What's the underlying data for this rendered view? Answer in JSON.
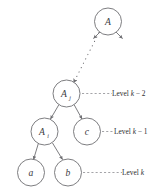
{
  "figure": {
    "type": "tree-diagram",
    "background_color": "#ffffff",
    "stroke_color": "#6e6e72",
    "text_color": "#2f2f33"
  },
  "nodes": [
    {
      "id": "A",
      "label": "A",
      "subscript": "",
      "cx": 108.0,
      "cy": 21.5,
      "r": 13.5
    },
    {
      "id": "Aj",
      "label": "A",
      "subscript": "j",
      "cx": 66.5,
      "cy": 93.5,
      "r": 13.5
    },
    {
      "id": "Ai",
      "label": "A",
      "subscript": "i",
      "cx": 44.5,
      "cy": 131.5,
      "r": 13.5
    },
    {
      "id": "c",
      "label": "c",
      "subscript": "",
      "cx": 87.0,
      "cy": 131.5,
      "r": 13.5
    },
    {
      "id": "a",
      "label": "a",
      "subscript": "",
      "cx": 31.0,
      "cy": 172.5,
      "r": 13.5
    },
    {
      "id": "b",
      "label": "b",
      "subscript": "",
      "cx": 68.0,
      "cy": 172.5,
      "r": 13.5
    }
  ],
  "edges": [
    {
      "from": "A",
      "to": "stub-left",
      "style": "solid",
      "arrow": true
    },
    {
      "from": "A",
      "to": "stub-right",
      "style": "solid",
      "arrow": true
    },
    {
      "from": "A",
      "to": "Aj",
      "style": "dotted",
      "arrow": true
    },
    {
      "from": "Aj",
      "to": "Ai",
      "style": "solid",
      "arrow": true
    },
    {
      "from": "Aj",
      "to": "c",
      "style": "solid",
      "arrow": true
    },
    {
      "from": "Ai",
      "to": "a",
      "style": "solid",
      "arrow": true
    },
    {
      "from": "Ai",
      "to": "b",
      "style": "solid",
      "arrow": true
    }
  ],
  "level_markers": [
    {
      "id": "level-k-minus-2",
      "text_prefix": "Level ",
      "text_var": "k",
      "text_suffix": " − 2",
      "anchor_node": "Aj",
      "leader_x1": 82,
      "leader_x2": 112,
      "y": 93.5,
      "text_x": 112
    },
    {
      "id": "level-k-minus-1",
      "text_prefix": "Level ",
      "text_var": "k",
      "text_suffix": " − 1",
      "anchor_node": "c",
      "leader_x1": 102,
      "leader_x2": 114,
      "y": 131.5,
      "text_x": 114
    },
    {
      "id": "level-k",
      "text_prefix": "Level ",
      "text_var": "k",
      "text_suffix": "",
      "anchor_node": "b",
      "leader_x1": 83,
      "leader_x2": 122,
      "y": 172.5,
      "text_x": 122
    }
  ]
}
